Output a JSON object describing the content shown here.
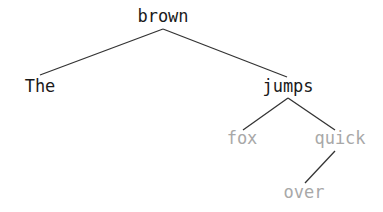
{
  "tree": {
    "nodes": [
      {
        "id": "brown",
        "label": "brown",
        "x": 163,
        "y": 6,
        "style": "dark"
      },
      {
        "id": "the",
        "label": "The",
        "x": 40,
        "y": 76,
        "style": "dark"
      },
      {
        "id": "jumps",
        "label": "jumps",
        "x": 288,
        "y": 76,
        "style": "dark"
      },
      {
        "id": "fox",
        "label": "fox",
        "x": 242,
        "y": 128,
        "style": "light"
      },
      {
        "id": "quick",
        "label": "quick",
        "x": 340,
        "y": 128,
        "style": "light"
      },
      {
        "id": "over",
        "label": "over",
        "x": 304,
        "y": 182,
        "style": "light"
      }
    ],
    "edges": [
      {
        "from": "brown",
        "to": "The"
      },
      {
        "from": "brown",
        "to": "jumps"
      },
      {
        "from": "jumps",
        "to": "fox"
      },
      {
        "from": "jumps",
        "to": "quick"
      },
      {
        "from": "quick",
        "to": "over"
      }
    ],
    "colors": {
      "dark_text": "#1a1a1a",
      "light_text": "#a8a8a8",
      "edge": "#333333"
    }
  }
}
